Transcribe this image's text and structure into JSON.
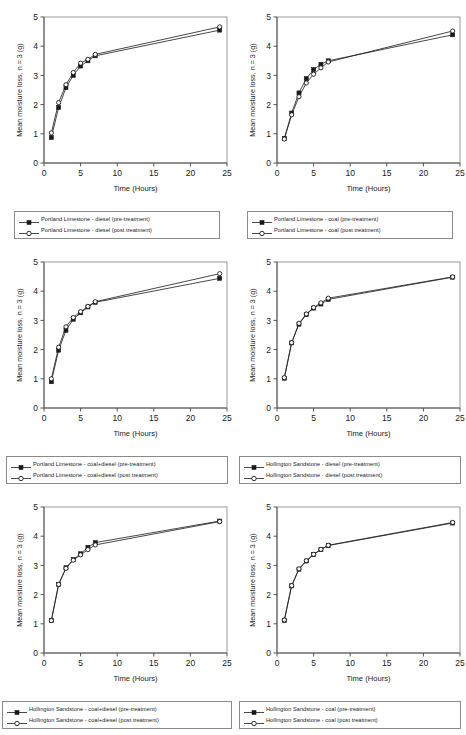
{
  "figure": {
    "background": "#ffffff",
    "series_color": "#1a1a1a",
    "axis_color": "#808080",
    "rows": 3,
    "cols": 2
  },
  "axes": {
    "xlabel": "Time (Hours)",
    "ylabel": "Mean moisture loss, n = 3 (g)",
    "xticks": [
      "0",
      "5",
      "10",
      "15",
      "20",
      "25"
    ],
    "yticks": [
      "0",
      "1",
      "2",
      "3",
      "4",
      "5"
    ],
    "xlim": [
      0,
      25
    ],
    "ylim": [
      0,
      5
    ]
  },
  "chart_data": [
    {
      "id": "portland-limestone-diesel",
      "type": "line",
      "title": "",
      "xlabel": "Time (Hours)",
      "ylabel": "Mean moisture loss, n = 3 (g)",
      "xlim": [
        0,
        25
      ],
      "ylim": [
        0,
        5
      ],
      "xticks": [
        0,
        5,
        10,
        15,
        20,
        25
      ],
      "yticks": [
        0,
        1,
        2,
        3,
        4,
        5
      ],
      "grid": false,
      "legend_position": "below",
      "x": [
        1,
        2,
        3,
        4,
        5,
        6,
        7,
        24
      ],
      "series": [
        {
          "name": "Portland Limestone - diesel (pre-treatment)",
          "marker": "filled-square",
          "values": [
            0.87,
            1.9,
            2.58,
            3.0,
            3.32,
            3.5,
            3.67,
            4.55
          ]
        },
        {
          "name": "Portland Limestone - diesel (post treatment)",
          "marker": "open-circle",
          "values": [
            1.03,
            2.07,
            2.68,
            3.1,
            3.42,
            3.55,
            3.72,
            4.66
          ]
        }
      ]
    },
    {
      "id": "portland-limestone-coal",
      "type": "line",
      "title": "",
      "xlabel": "Time (Hours)",
      "ylabel": "Mean moisture loss, n = 3 (g)",
      "xlim": [
        0,
        25
      ],
      "ylim": [
        0,
        5
      ],
      "xticks": [
        0,
        5,
        10,
        15,
        20,
        25
      ],
      "yticks": [
        0,
        1,
        2,
        3,
        4,
        5
      ],
      "grid": false,
      "legend_position": "below",
      "x": [
        1,
        2,
        3,
        4,
        5,
        6,
        7,
        24
      ],
      "series": [
        {
          "name": "Portland Limestone - coal (pre-treatment)",
          "marker": "filled-square",
          "values": [
            0.84,
            1.71,
            2.4,
            2.89,
            3.2,
            3.38,
            3.5,
            4.39
          ]
        },
        {
          "name": "Portland Limestone - coal (post treatment)",
          "marker": "open-circle",
          "values": [
            0.82,
            1.65,
            2.27,
            2.74,
            3.04,
            3.26,
            3.46,
            4.52
          ]
        }
      ]
    },
    {
      "id": "portland-limestone-coal-diesel",
      "type": "line",
      "title": "",
      "xlabel": "Time (Hours)",
      "ylabel": "Mean moisture loss, n = 3 (g)",
      "xlim": [
        0,
        25
      ],
      "ylim": [
        0,
        5
      ],
      "xticks": [
        0,
        5,
        10,
        15,
        20,
        25
      ],
      "yticks": [
        0,
        1,
        2,
        3,
        4,
        5
      ],
      "grid": false,
      "legend_position": "below",
      "x": [
        1,
        2,
        3,
        4,
        5,
        6,
        7,
        24
      ],
      "series": [
        {
          "name": "Portland Limestone - coal+diesel  (pre-treatment)",
          "marker": "filled-square",
          "values": [
            0.9,
            1.98,
            2.66,
            3.04,
            3.26,
            3.46,
            3.62,
            4.44
          ]
        },
        {
          "name": "Portland Limestone - coal+diesel (post treatment)",
          "marker": "open-circle",
          "values": [
            1.0,
            2.08,
            2.78,
            3.1,
            3.3,
            3.48,
            3.64,
            4.6
          ]
        }
      ]
    },
    {
      "id": "hollington-sandstone-diesel",
      "type": "line",
      "title": "",
      "xlabel": "Time (Hours)",
      "ylabel": "Mean moisture loss, n = 3 (g)",
      "xlim": [
        0,
        25
      ],
      "ylim": [
        0,
        5
      ],
      "xticks": [
        0,
        5,
        10,
        15,
        20,
        25
      ],
      "yticks": [
        0,
        1,
        2,
        3,
        4,
        5
      ],
      "grid": false,
      "legend_position": "below",
      "x": [
        1,
        2,
        3,
        4,
        5,
        6,
        7,
        24
      ],
      "series": [
        {
          "name": "Hollington Sandstone - diesel (pre-treatment)",
          "marker": "filled-square",
          "values": [
            1.02,
            2.23,
            2.87,
            3.2,
            3.42,
            3.56,
            3.72,
            4.48
          ]
        },
        {
          "name": "Hollington Sandstone - diesel (post treatment)",
          "marker": "open-circle",
          "values": [
            1.04,
            2.24,
            2.9,
            3.22,
            3.44,
            3.6,
            3.76,
            4.49
          ]
        }
      ]
    },
    {
      "id": "hollington-sandstone-coal-diesel",
      "type": "line",
      "title": "",
      "xlabel": "Time (Hours)",
      "ylabel": "Mean moisture loss, n = 3 (g)",
      "xlim": [
        0,
        25
      ],
      "ylim": [
        0,
        5
      ],
      "xticks": [
        0,
        5,
        10,
        15,
        20,
        25
      ],
      "yticks": [
        0,
        1,
        2,
        3,
        4,
        5
      ],
      "grid": false,
      "legend_position": "below",
      "x": [
        1,
        2,
        3,
        4,
        5,
        6,
        7,
        24
      ],
      "series": [
        {
          "name": "Hollington Sandstone - coal+diesel  (pre-treatment)",
          "marker": "filled-square",
          "values": [
            1.11,
            2.35,
            2.92,
            3.2,
            3.4,
            3.62,
            3.78,
            4.52
          ]
        },
        {
          "name": "Hollington Sandstone - coal+diesel (post treatment)",
          "marker": "open-circle",
          "values": [
            1.11,
            2.35,
            2.9,
            3.18,
            3.36,
            3.54,
            3.7,
            4.5
          ]
        }
      ]
    },
    {
      "id": "hollington-sandstone-coal",
      "type": "line",
      "title": "",
      "xlabel": "Time (Hours)",
      "ylabel": "Mean moisture loss, n = 3 (g)",
      "xlim": [
        0,
        25
      ],
      "ylim": [
        0,
        5
      ],
      "xticks": [
        0,
        5,
        10,
        15,
        20,
        25
      ],
      "yticks": [
        0,
        1,
        2,
        3,
        4,
        5
      ],
      "grid": false,
      "legend_position": "below",
      "x": [
        1,
        2,
        3,
        4,
        5,
        6,
        7,
        24
      ],
      "series": [
        {
          "name": "Hollington Sandstone - coal (pre-treatment)",
          "marker": "filled-square",
          "values": [
            1.12,
            2.3,
            2.87,
            3.15,
            3.37,
            3.54,
            3.68,
            4.45
          ]
        },
        {
          "name": "Hollington Sandstone - coal (post treatment)",
          "marker": "open-circle",
          "values": [
            1.13,
            2.31,
            2.88,
            3.16,
            3.38,
            3.55,
            3.69,
            4.47
          ]
        }
      ]
    }
  ]
}
